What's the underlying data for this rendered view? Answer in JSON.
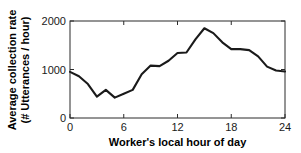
{
  "chart_data": {
    "type": "line",
    "title": "",
    "xlabel": "Worker's local hour of day",
    "ylabel_line1": "Average collection rate",
    "ylabel_line2": "(# Utterances / hour)",
    "xlim": [
      0,
      24
    ],
    "ylim": [
      0,
      2000
    ],
    "xticks": [
      0,
      6,
      12,
      18,
      24
    ],
    "xticklabels": [
      "0",
      "6",
      "12",
      "18",
      "24"
    ],
    "yticks": [
      0,
      1000,
      2000
    ],
    "yticklabels": [
      "0",
      "1000",
      "2000"
    ],
    "grid": false,
    "legend": null,
    "line_color": "#1a1a1a",
    "axis_color": "#2b2b2b",
    "background_color": "#ffffff",
    "x": [
      0,
      1,
      2,
      3,
      4,
      5,
      6,
      7,
      8,
      9,
      10,
      11,
      12,
      13,
      14,
      15,
      16,
      17,
      18,
      19,
      20,
      21,
      22,
      23,
      24
    ],
    "values": [
      950,
      860,
      700,
      440,
      580,
      420,
      500,
      580,
      900,
      1080,
      1070,
      1180,
      1340,
      1350,
      1620,
      1850,
      1750,
      1560,
      1420,
      1420,
      1400,
      1270,
      1060,
      980,
      960
    ],
    "series": [
      {
        "name": "Average collection rate",
        "values": [
          950,
          860,
          700,
          440,
          580,
          420,
          500,
          580,
          900,
          1080,
          1070,
          1180,
          1340,
          1350,
          1620,
          1850,
          1750,
          1560,
          1420,
          1420,
          1400,
          1270,
          1060,
          980,
          960
        ]
      }
    ]
  }
}
